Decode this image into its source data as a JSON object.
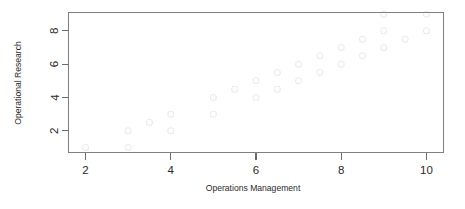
{
  "chart_data": {
    "type": "scatter",
    "title": "",
    "xlabel": "Operations Management",
    "ylabel": "Operational Research",
    "xlim": [
      1.6,
      10.4
    ],
    "ylim": [
      0.7,
      9.1
    ],
    "xticks": [
      2,
      4,
      6,
      8,
      10
    ],
    "xtick_labels": [
      "2",
      "4",
      "6",
      "8",
      "10"
    ],
    "yticks": [
      2,
      4,
      6,
      8
    ],
    "ytick_labels": [
      "2",
      "4",
      "6",
      "8"
    ],
    "grid": false,
    "legend": null,
    "point_marker": "open-circle",
    "point_color": "#ebebeb",
    "axis_color": "#808080",
    "background": "#ffffff",
    "points": [
      {
        "x": 2.0,
        "y": 1.0
      },
      {
        "x": 3.0,
        "y": 1.0
      },
      {
        "x": 3.0,
        "y": 2.0
      },
      {
        "x": 3.5,
        "y": 2.5
      },
      {
        "x": 4.0,
        "y": 3.0
      },
      {
        "x": 4.0,
        "y": 2.0
      },
      {
        "x": 5.0,
        "y": 4.0
      },
      {
        "x": 5.0,
        "y": 3.0
      },
      {
        "x": 5.5,
        "y": 4.5
      },
      {
        "x": 6.0,
        "y": 5.0
      },
      {
        "x": 6.0,
        "y": 4.0
      },
      {
        "x": 6.5,
        "y": 5.5
      },
      {
        "x": 6.5,
        "y": 4.5
      },
      {
        "x": 7.0,
        "y": 6.0
      },
      {
        "x": 7.0,
        "y": 5.0
      },
      {
        "x": 7.5,
        "y": 6.5
      },
      {
        "x": 7.5,
        "y": 5.5
      },
      {
        "x": 8.0,
        "y": 7.0
      },
      {
        "x": 8.0,
        "y": 6.0
      },
      {
        "x": 8.5,
        "y": 7.5
      },
      {
        "x": 8.5,
        "y": 6.5
      },
      {
        "x": 9.0,
        "y": 9.0
      },
      {
        "x": 9.0,
        "y": 8.0
      },
      {
        "x": 9.0,
        "y": 7.0
      },
      {
        "x": 9.5,
        "y": 7.5
      },
      {
        "x": 10.0,
        "y": 9.0
      },
      {
        "x": 10.0,
        "y": 8.0
      }
    ]
  },
  "labels": {
    "x_axis_title": "Operations Management",
    "y_axis_title": "Operational Research"
  }
}
